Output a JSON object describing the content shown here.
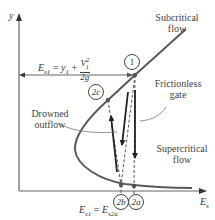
{
  "diagram": {
    "axes": {
      "y_label": "y",
      "x_label": "E",
      "x_label_sub": "s"
    },
    "labels": {
      "subcritical": [
        "Subcritical",
        "flow"
      ],
      "supercritical": [
        "Supercritical",
        "flow"
      ],
      "frictionless_gate": [
        "Frictionless",
        "gate"
      ],
      "drowned_outflow": [
        "Drowned",
        "outflow"
      ]
    },
    "equation_top": {
      "lhs": "E",
      "lhs_sub": "s1",
      "rhs_a": "y",
      "rhs_a_sub": "1",
      "plus": "+",
      "frac_num": "V",
      "frac_num_sup": "2",
      "frac_num_sub": "1",
      "frac_den": "2g"
    },
    "equation_bottom": {
      "lhs": "E",
      "lhs_sub": "s1",
      "eq": "=",
      "rhs": "E",
      "rhs_sub": "s2a"
    },
    "points": [
      {
        "id": "1",
        "label": "1"
      },
      {
        "id": "2c",
        "label": "2c"
      },
      {
        "id": "2b",
        "label": "2b"
      },
      {
        "id": "2a",
        "label": "2a"
      }
    ],
    "colors": {
      "curve": "#5a5a5a",
      "axis": "#666666",
      "arrow": "#222222",
      "dashed": "#555555"
    }
  }
}
